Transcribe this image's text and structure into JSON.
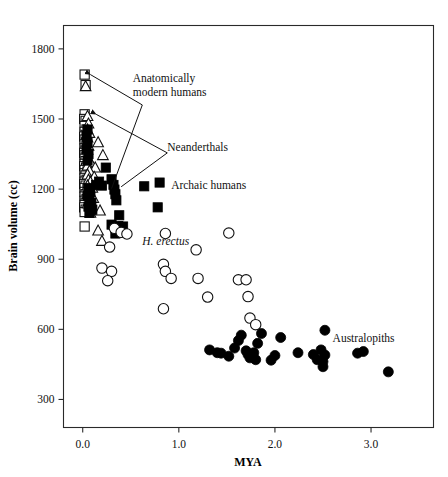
{
  "chart_data": {
    "type": "scatter",
    "title": "",
    "xlabel": "MYA",
    "ylabel": "Brain volume (cc)",
    "xlim": [
      -0.2,
      3.65
    ],
    "ylim": [
      180,
      1900
    ],
    "xticks": [
      0.0,
      1.0,
      2.0,
      3.0
    ],
    "xticklabels": [
      "0.0",
      "1.0",
      "2.0",
      "3.0"
    ],
    "yticks": [
      300,
      600,
      900,
      1200,
      1500,
      1800
    ],
    "yticklabels": [
      "300",
      "600",
      "900",
      "1200",
      "1500",
      "1800"
    ],
    "grid": false,
    "legend_position": "none",
    "annotations": [
      {
        "name": "anatomically-modern-humans",
        "lines": [
          "Anatomically",
          "modern humans"
        ],
        "x": 0.52,
        "y": 1660,
        "style": "normal"
      },
      {
        "name": "neanderthals",
        "lines": [
          "Neanderthals"
        ],
        "x": 0.88,
        "y": 1365,
        "style": "normal"
      },
      {
        "name": "archaic-humans",
        "lines": [
          "Archaic humans"
        ],
        "x": 0.92,
        "y": 1200,
        "style": "normal"
      },
      {
        "name": "h-erectus",
        "lines": [
          "H. erectus"
        ],
        "x": 0.62,
        "y": 960,
        "style": "italic"
      },
      {
        "name": "australopiths",
        "lines": [
          "Australopiths"
        ],
        "x": 2.6,
        "y": 545,
        "style": "normal"
      }
    ],
    "leaders": [
      {
        "name": "leader-amh",
        "points": [
          [
            0.08,
            1690
          ],
          [
            0.62,
            1560
          ],
          [
            0.3,
            1202
          ]
        ],
        "arrow_at": "start"
      },
      {
        "name": "leader-neanderthals",
        "points": [
          [
            0.14,
            1520
          ],
          [
            0.88,
            1355
          ],
          [
            0.4,
            1210
          ]
        ],
        "arrow_at": "start"
      }
    ],
    "series": [
      {
        "name": "Anatomically modern humans",
        "marker": "open-square",
        "points": [
          [
            0.02,
            1690
          ],
          [
            0.03,
            1645
          ],
          [
            0.02,
            1520
          ],
          [
            0.015,
            1500
          ],
          [
            0.03,
            1492
          ],
          [
            0.02,
            1470
          ],
          [
            0.04,
            1455
          ],
          [
            0.02,
            1445
          ],
          [
            0.03,
            1432
          ],
          [
            0.015,
            1425
          ],
          [
            0.02,
            1412
          ],
          [
            0.035,
            1400
          ],
          [
            0.02,
            1392
          ],
          [
            0.04,
            1385
          ],
          [
            0.02,
            1375
          ],
          [
            0.03,
            1365
          ],
          [
            0.015,
            1355
          ],
          [
            0.02,
            1345
          ],
          [
            0.04,
            1338
          ],
          [
            0.02,
            1330
          ],
          [
            0.03,
            1320
          ],
          [
            0.02,
            1308
          ],
          [
            0.015,
            1298
          ],
          [
            0.035,
            1292
          ],
          [
            0.02,
            1282
          ],
          [
            0.05,
            1275
          ],
          [
            0.02,
            1268
          ],
          [
            0.03,
            1258
          ],
          [
            0.02,
            1248
          ],
          [
            0.04,
            1240
          ],
          [
            0.02,
            1232
          ],
          [
            0.015,
            1222
          ],
          [
            0.03,
            1215
          ],
          [
            0.02,
            1205
          ],
          [
            0.05,
            1198
          ],
          [
            0.02,
            1188
          ],
          [
            0.03,
            1178
          ],
          [
            0.02,
            1168
          ],
          [
            0.04,
            1158
          ],
          [
            0.02,
            1150
          ],
          [
            0.03,
            1142
          ],
          [
            0.02,
            1132
          ],
          [
            0.015,
            1122
          ],
          [
            0.03,
            1112
          ],
          [
            0.02,
            1102
          ],
          [
            0.02,
            1040
          ]
        ]
      },
      {
        "name": "Neanderthals",
        "marker": "open-triangle",
        "points": [
          [
            0.03,
            1640
          ],
          [
            0.05,
            1512
          ],
          [
            0.06,
            1480
          ],
          [
            0.05,
            1455
          ],
          [
            0.07,
            1440
          ],
          [
            0.05,
            1420
          ],
          [
            0.16,
            1400
          ],
          [
            0.06,
            1385
          ],
          [
            0.05,
            1368
          ],
          [
            0.21,
            1345
          ],
          [
            0.06,
            1330
          ],
          [
            0.08,
            1315
          ],
          [
            0.05,
            1300
          ],
          [
            0.13,
            1292
          ],
          [
            0.07,
            1278
          ],
          [
            0.05,
            1262
          ],
          [
            0.12,
            1252
          ],
          [
            0.06,
            1240
          ],
          [
            0.08,
            1230
          ],
          [
            0.05,
            1215
          ],
          [
            0.1,
            1205
          ],
          [
            0.06,
            1192
          ],
          [
            0.05,
            1178
          ],
          [
            0.11,
            1162
          ],
          [
            0.07,
            1150
          ],
          [
            0.05,
            1138
          ],
          [
            0.18,
            1108
          ],
          [
            0.08,
            1098
          ],
          [
            0.16,
            1022
          ],
          [
            0.2,
            978
          ]
        ]
      },
      {
        "name": "Archaic humans",
        "marker": "filled-square",
        "points": [
          [
            0.05,
            1455
          ],
          [
            0.04,
            1428
          ],
          [
            0.05,
            1398
          ],
          [
            0.04,
            1372
          ],
          [
            0.06,
            1350
          ],
          [
            0.05,
            1322
          ],
          [
            0.24,
            1292
          ],
          [
            0.17,
            1232
          ],
          [
            0.14,
            1218
          ],
          [
            0.2,
            1215
          ],
          [
            0.3,
            1242
          ],
          [
            0.32,
            1218
          ],
          [
            0.33,
            1198
          ],
          [
            0.34,
            1178
          ],
          [
            0.35,
            1152
          ],
          [
            0.06,
            1205
          ],
          [
            0.08,
            1188
          ],
          [
            0.05,
            1172
          ],
          [
            0.07,
            1158
          ],
          [
            0.09,
            1142
          ],
          [
            0.06,
            1125
          ],
          [
            0.1,
            1112
          ],
          [
            0.07,
            1098
          ],
          [
            0.64,
            1212
          ],
          [
            0.8,
            1228
          ],
          [
            0.78,
            1122
          ],
          [
            0.38,
            1088
          ],
          [
            0.3,
            1048
          ],
          [
            0.37,
            1042
          ],
          [
            0.42,
            1040
          ],
          [
            0.34,
            1010
          ]
        ]
      },
      {
        "name": "Homo erectus",
        "marker": "open-circle",
        "points": [
          [
            0.33,
            1032
          ],
          [
            0.4,
            1015
          ],
          [
            0.46,
            1008
          ],
          [
            0.28,
            952
          ],
          [
            0.2,
            862
          ],
          [
            0.3,
            848
          ],
          [
            0.26,
            808
          ],
          [
            0.86,
            1010
          ],
          [
            0.84,
            878
          ],
          [
            0.86,
            848
          ],
          [
            0.92,
            818
          ],
          [
            1.18,
            940
          ],
          [
            1.2,
            818
          ],
          [
            1.3,
            738
          ],
          [
            0.84,
            688
          ],
          [
            1.52,
            1012
          ],
          [
            1.62,
            812
          ],
          [
            1.7,
            812
          ],
          [
            1.72,
            740
          ],
          [
            1.74,
            648
          ],
          [
            1.8,
            620
          ]
        ]
      },
      {
        "name": "Australopiths",
        "marker": "filled-circle",
        "points": [
          [
            1.32,
            512
          ],
          [
            1.4,
            500
          ],
          [
            1.44,
            498
          ],
          [
            1.52,
            485
          ],
          [
            1.58,
            520
          ],
          [
            1.62,
            552
          ],
          [
            1.65,
            575
          ],
          [
            1.7,
            508
          ],
          [
            1.72,
            492
          ],
          [
            1.74,
            478
          ],
          [
            1.78,
            500
          ],
          [
            1.8,
            470
          ],
          [
            1.82,
            540
          ],
          [
            1.86,
            582
          ],
          [
            1.96,
            468
          ],
          [
            2.0,
            488
          ],
          [
            2.06,
            565
          ],
          [
            2.24,
            500
          ],
          [
            2.4,
            492
          ],
          [
            2.44,
            470
          ],
          [
            2.48,
            512
          ],
          [
            2.5,
            462
          ],
          [
            2.5,
            440
          ],
          [
            2.52,
            490
          ],
          [
            2.52,
            596
          ],
          [
            2.86,
            498
          ],
          [
            2.92,
            505
          ],
          [
            3.18,
            418
          ]
        ]
      }
    ]
  },
  "axes": {
    "x_title": "MYA",
    "y_title": "Brain volume (cc)"
  }
}
